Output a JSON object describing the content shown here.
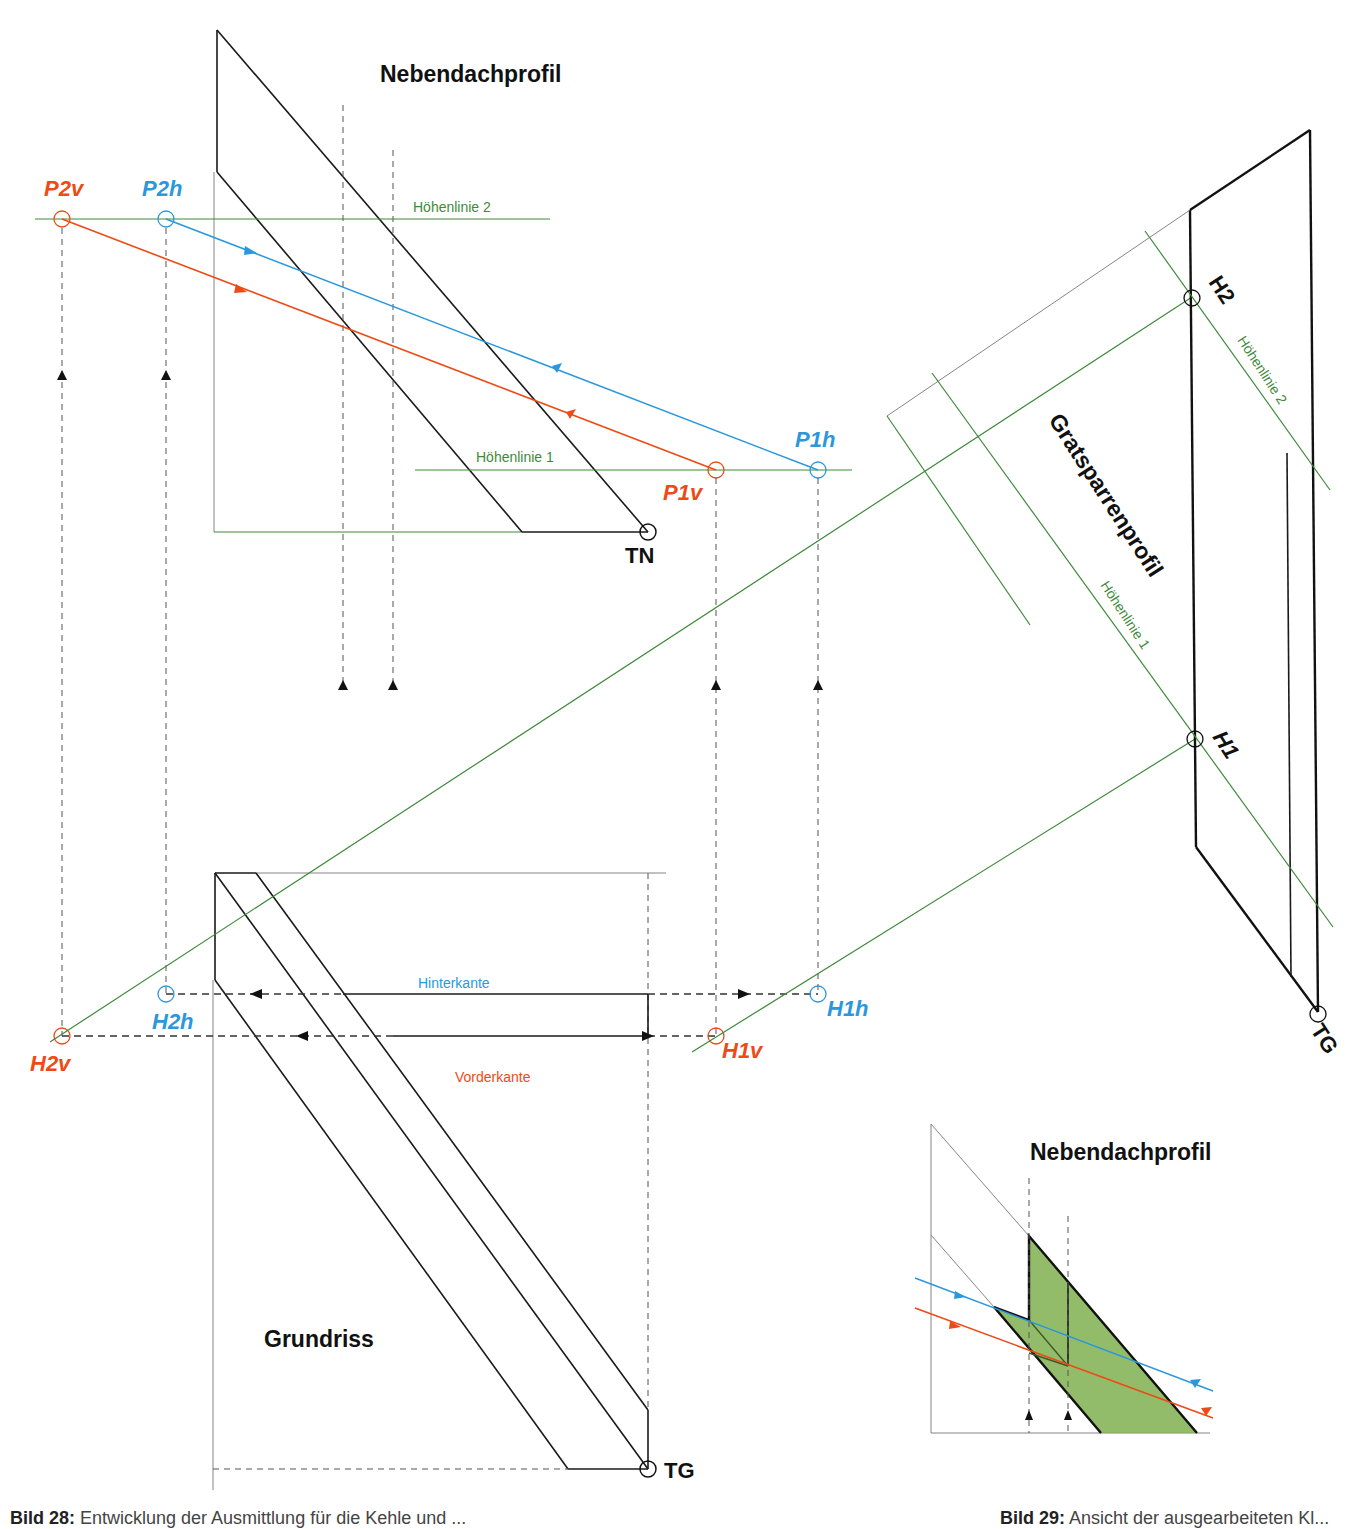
{
  "diagram": {
    "colors": {
      "green": "#3f8a3a",
      "blue": "#2b97dc",
      "red": "#ee4a16",
      "black": "#111111",
      "fill_green": "#7fb04f"
    },
    "titles": {
      "nebendachprofil": "Nebendachprofil",
      "gratsparrenprofil": "Gratsparrenprofil",
      "grundriss": "Grundriss",
      "nebendachprofil_inset": "Nebendachprofil"
    },
    "lines": {
      "hoehenlinie_2_top": "Höhenlinie 2",
      "hoehenlinie_1_top": "Höhenlinie 1",
      "hoehenlinie_2_right": "Höhenlinie 2",
      "hoehenlinie_1_right": "Höhenlinie 1",
      "hinterkante": "Hinterkante",
      "vorderkante": "Vorderkante"
    },
    "points": {
      "P2v": "P2v",
      "P2h": "P2h",
      "P1v": "P1v",
      "P1h": "P1h",
      "TN": "TN",
      "H2": "H2",
      "H1": "H1",
      "H2h": "H2h",
      "H2v": "H2v",
      "H1h": "H1h",
      "H1v": "H1v",
      "TG_right": "TG",
      "TG_bottom": "TG"
    }
  },
  "captions": {
    "left_prefix": "Bild 28:",
    "left_text": "Entwicklung der Ausmittlung für die Kehle und ...",
    "right_prefix": "Bild 29:",
    "right_text": "Ansicht der ausgearbeiteten Kl..."
  }
}
